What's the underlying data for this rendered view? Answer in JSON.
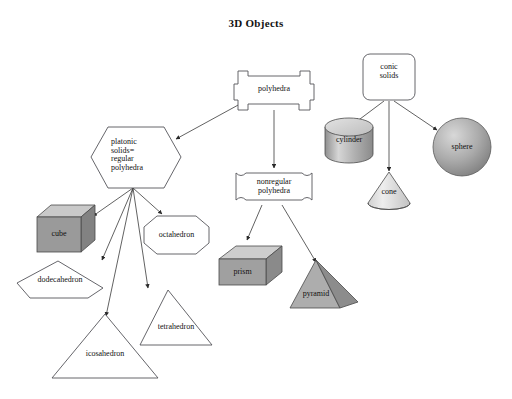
{
  "page": {
    "title": "3D Objects",
    "background": "#ffffff",
    "stroke": "#55555a",
    "text_color": "#111111"
  },
  "palette": {
    "fill_white": "#ffffff",
    "cube_front": "#9a9a9a",
    "cube_top": "#c9c9c9",
    "cube_side": "#828282",
    "prism_front": "#a0a0a0",
    "prism_top": "#cdcdcd",
    "prism_side": "#8a8a8a",
    "pyramid_front": "#adadad",
    "pyramid_side": "#8c8c8c",
    "cylinder_body": "#b5b5b5",
    "cylinder_top": "#d2d2d2",
    "cone_fill": "#dcdcdc",
    "sphere_fill": "#a8a8a8"
  },
  "nodes": {
    "polyhedra": {
      "label": "polyhedra",
      "shape": "cross-banner"
    },
    "platonic": {
      "label": "platonic\nsolids=\nregular\npolyhedra",
      "shape": "hexagon"
    },
    "nonregular": {
      "label": "nonregular\npolyhedra",
      "shape": "flared-rectangle"
    },
    "conic": {
      "label": "conic\nsolids",
      "shape": "rounded-rectangle"
    },
    "cube": {
      "label": "cube",
      "shape": "cube-3d"
    },
    "octahedron": {
      "label": "octahedron",
      "shape": "octagon"
    },
    "dodecahedron": {
      "label": "dodecahedron",
      "shape": "pentagon"
    },
    "icosahedron": {
      "label": "icosahedron",
      "shape": "triangle"
    },
    "tetrahedron": {
      "label": "tetrahedron",
      "shape": "triangle"
    },
    "prism": {
      "label": "prism",
      "shape": "box-3d"
    },
    "pyramid": {
      "label": "pyramid",
      "shape": "pyramid-3d"
    },
    "cylinder": {
      "label": "cylinder",
      "shape": "cylinder-3d"
    },
    "cone": {
      "label": "cone",
      "shape": "cone-3d"
    },
    "sphere": {
      "label": "sphere",
      "shape": "sphere-3d"
    }
  },
  "edges": [
    {
      "from": "polyhedra",
      "to": "platonic"
    },
    {
      "from": "polyhedra",
      "to": "nonregular"
    },
    {
      "from": "platonic",
      "to": "cube"
    },
    {
      "from": "platonic",
      "to": "octahedron"
    },
    {
      "from": "platonic",
      "to": "dodecahedron"
    },
    {
      "from": "platonic",
      "to": "icosahedron"
    },
    {
      "from": "platonic",
      "to": "tetrahedron"
    },
    {
      "from": "nonregular",
      "to": "prism"
    },
    {
      "from": "nonregular",
      "to": "pyramid"
    },
    {
      "from": "conic",
      "to": "cylinder"
    },
    {
      "from": "conic",
      "to": "cone"
    },
    {
      "from": "conic",
      "to": "sphere"
    }
  ]
}
